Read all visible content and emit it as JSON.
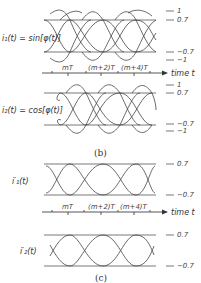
{
  "figure": {
    "panel_b": {
      "caption": "(b)",
      "signal1": {
        "label": "i₁(t) = sin[φ(t)]",
        "levels": [
          "1",
          "0.7",
          "−0.7",
          "−1"
        ]
      },
      "signal2": {
        "label": "i₂(t) = cos[φ(t)]",
        "levels": [
          "1",
          "0.7",
          "−0.7",
          "−1"
        ]
      },
      "time_axis": {
        "ticks": [
          "mT",
          "(m+2)T",
          "(m+4)T"
        ],
        "label": "time t"
      }
    },
    "panel_c": {
      "caption": "(c)",
      "signal1": {
        "label": "i′₁(t)",
        "levels": [
          "0.7",
          "−0.7"
        ]
      },
      "signal2": {
        "label": "i′₂(t)",
        "levels": [
          "0.7",
          "−0.7"
        ]
      },
      "time_axis": {
        "ticks": [
          "mT",
          "(m+2)T",
          "(m+4)T"
        ],
        "label": "time t"
      }
    }
  }
}
